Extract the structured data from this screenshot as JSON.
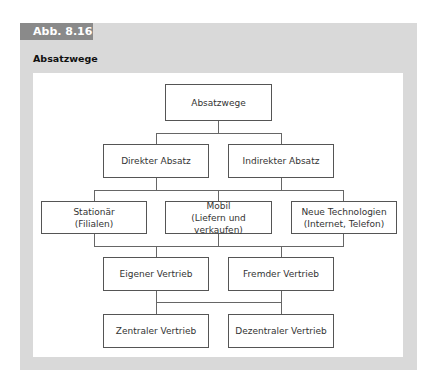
{
  "figure": {
    "label": "Abb. 8.16",
    "title": "Absatzwege"
  },
  "diagram": {
    "root": "Absatzwege",
    "level1": [
      "Direkter Absatz",
      "Indirekter Absatz"
    ],
    "level2": [
      {
        "line1": "Stationär",
        "line2": "(Filialen)"
      },
      {
        "line1": "Mobil",
        "line2": "(Liefern und verkaufen)"
      },
      {
        "line1": "Neue Technologien",
        "line2": "(Internet, Telefon)"
      }
    ],
    "level3": [
      "Eigener Vertrieb",
      "Fremder Vertrieb"
    ],
    "level4": [
      "Zentraler Vertrieb",
      "Dezentraler Vertrieb"
    ]
  },
  "colors": {
    "panel": "#d9d9d9",
    "tab": "#8a8a8a",
    "box_border": "#555555"
  }
}
